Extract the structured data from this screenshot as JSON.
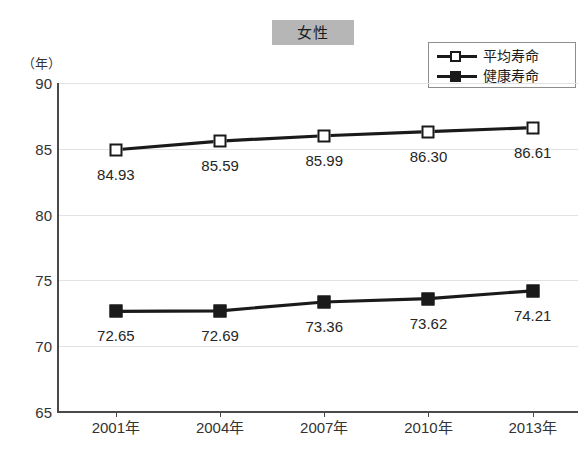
{
  "title": {
    "text": "女性"
  },
  "axis": {
    "y_unit_label": "（年）",
    "y_ticks": [
      "90",
      "85",
      "80",
      "75",
      "70",
      "65"
    ],
    "x_ticks": [
      "2001年",
      "2004年",
      "2007年",
      "2010年",
      "2013年"
    ]
  },
  "legend": {
    "items": [
      {
        "label": "平均寿命",
        "marker": "open-square-marker"
      },
      {
        "label": "健康寿命",
        "marker": "filled-square-marker"
      }
    ]
  },
  "chart_data": {
    "type": "line",
    "title": "女性",
    "xlabel": "",
    "ylabel": "（年）",
    "ylim": [
      65,
      90
    ],
    "yticks": [
      65,
      70,
      75,
      80,
      85,
      90
    ],
    "grid": true,
    "legend_position": "top-right",
    "categories": [
      "2001年",
      "2004年",
      "2007年",
      "2010年",
      "2013年"
    ],
    "series": [
      {
        "name": "平均寿命",
        "marker": "open-square",
        "values": [
          84.93,
          85.59,
          85.99,
          86.3,
          86.61
        ],
        "labels": [
          "84.93",
          "85.59",
          "85.99",
          "86.30",
          "86.61"
        ]
      },
      {
        "name": "健康寿命",
        "marker": "filled-square",
        "values": [
          72.65,
          72.69,
          73.36,
          73.62,
          74.21
        ],
        "labels": [
          "72.65",
          "72.69",
          "73.36",
          "73.62",
          "74.21"
        ]
      }
    ]
  },
  "colors": {
    "series_line": "#1a1a1a",
    "grid": "#e2e2e2",
    "axis": "#4a4a4a",
    "title_banner": "#b6b6b6",
    "text": "#262626"
  }
}
